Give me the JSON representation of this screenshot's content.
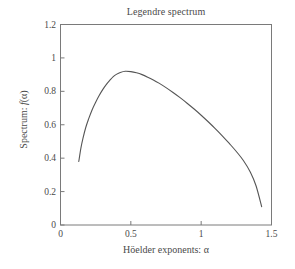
{
  "chart_data": {
    "type": "line",
    "title": "Legendre spectrum",
    "xlabel": "Höelder exponents: α",
    "ylabel": "Spectrum: f(α)",
    "ylabel_prefix": "Spectrum: ",
    "ylabel_fn": "f",
    "ylabel_arg": "(α)",
    "xlim": [
      0,
      1.5
    ],
    "ylim": [
      0,
      1.2
    ],
    "grid": false,
    "legend": "none",
    "line_color": "#555555",
    "axis_color": "#7a7a7a",
    "xticks": [
      0,
      0.5,
      1,
      1.5
    ],
    "xtick_labels": [
      "0",
      "0.5",
      "1",
      "1.5"
    ],
    "yticks": [
      0,
      0.2,
      0.4,
      0.6,
      0.8,
      1,
      1.2
    ],
    "ytick_labels": [
      "0",
      "0.2",
      "0.4",
      "0.6",
      "0.8",
      "1",
      "1.2"
    ],
    "series": [
      {
        "name": "Legendre spectrum",
        "x": [
          0.13,
          0.145,
          0.16,
          0.18,
          0.2,
          0.225,
          0.25,
          0.275,
          0.3,
          0.325,
          0.35,
          0.375,
          0.4,
          0.425,
          0.46,
          0.5,
          0.54,
          0.58,
          0.62,
          0.66,
          0.7,
          0.75,
          0.8,
          0.85,
          0.9,
          0.95,
          1.0,
          1.05,
          1.1,
          1.15,
          1.2,
          1.25,
          1.3,
          1.35,
          1.39,
          1.43
        ],
        "y": [
          0.38,
          0.46,
          0.52,
          0.585,
          0.635,
          0.69,
          0.735,
          0.775,
          0.81,
          0.84,
          0.865,
          0.888,
          0.903,
          0.913,
          0.92,
          0.918,
          0.911,
          0.9,
          0.885,
          0.868,
          0.849,
          0.822,
          0.793,
          0.762,
          0.729,
          0.694,
          0.657,
          0.618,
          0.577,
          0.534,
          0.488,
          0.44,
          0.386,
          0.316,
          0.235,
          0.11
        ]
      }
    ],
    "annotations": {
      "peak_x": 0.46,
      "peak_y": 0.92,
      "left_endpoint": [
        0.13,
        0.38
      ],
      "right_endpoint": [
        1.43,
        0.11
      ]
    }
  }
}
